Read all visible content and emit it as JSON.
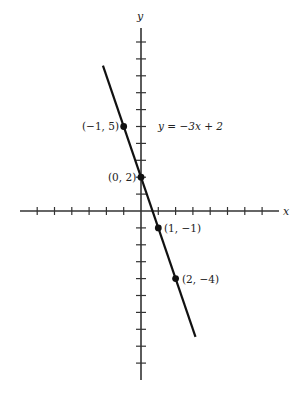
{
  "chart_data": {
    "type": "line",
    "title": "",
    "xlabel": "x",
    "ylabel": "y",
    "equation": "y = −3x + 2",
    "xlim": [
      -7,
      8
    ],
    "ylim": [
      -11,
      11
    ],
    "x_ticks": [
      -6,
      -5,
      -4,
      -3,
      -2,
      -1,
      1,
      2,
      3,
      4,
      5,
      6,
      7
    ],
    "y_ticks": [
      -10,
      -9,
      -8,
      -7,
      -6,
      -5,
      -4,
      -3,
      -2,
      -1,
      1,
      2,
      3,
      4,
      5,
      6,
      7,
      8,
      9,
      10
    ],
    "grid": false,
    "series": [
      {
        "name": "y = −3x + 2",
        "line": {
          "x_start": -2.2,
          "y_start": 8.6,
          "x_end": 3.15,
          "y_end": -7.45
        },
        "slope": -3,
        "intercept": 2
      }
    ],
    "points": [
      {
        "x": -1,
        "y": 5,
        "label": "(−1, 5)"
      },
      {
        "x": 0,
        "y": 2,
        "label": "(0, 2)"
      },
      {
        "x": 1,
        "y": -1,
        "label": "(1, −1)"
      },
      {
        "x": 2,
        "y": -4,
        "label": "(2, −4)"
      }
    ]
  },
  "labels": {
    "x_axis": "x",
    "y_axis": "y",
    "equation": "y = −3x + 2",
    "p1": "(−1, 5)",
    "p2": "(0, 2)",
    "p3": "(1, −1)",
    "p4": "(2, −4)"
  }
}
